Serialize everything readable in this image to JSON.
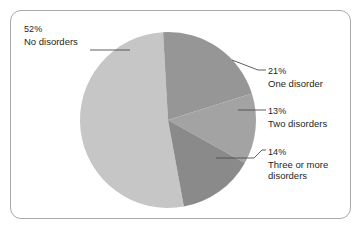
{
  "figure": {
    "background_color": "#ffffff",
    "border_color": "#a9a9a9"
  },
  "chart_data": {
    "type": "pie",
    "title": "",
    "subtitle": "",
    "xlabel": "",
    "ylabel": "",
    "legend_position": "callout-labels",
    "grid": false,
    "total": 100,
    "unit": "%",
    "categories": [
      "No disorders",
      "One disorder",
      "Two disorders",
      "Three or more disorders"
    ],
    "values": [
      52,
      21,
      13,
      14
    ],
    "colors": [
      "#c6c6c6",
      "#969696",
      "#a3a3a3",
      "#8a8a8a"
    ],
    "slices": [
      {
        "label": "No disorders",
        "value": 52,
        "percent_text": "52%",
        "color": "#c6c6c6",
        "start_angle_deg": 172,
        "end_angle_deg": 359.2
      },
      {
        "label": "One disorder",
        "value": 21,
        "percent_text": "21%",
        "color": "#969696",
        "start_angle_deg": 359.2,
        "end_angle_deg": 75.8
      },
      {
        "label": "Two disorders",
        "value": 13,
        "percent_text": "13%",
        "color": "#a3a3a3",
        "start_angle_deg": 75.8,
        "end_angle_deg": 122.6
      },
      {
        "label": "Three or more disorders",
        "value": 14,
        "percent_text": "14%",
        "color": "#8a8a8a",
        "start_angle_deg": 122.6,
        "end_angle_deg": 172
      }
    ]
  },
  "labels": {
    "no_disorders": {
      "percent": "52%",
      "name": "No disorders"
    },
    "one_disorder": {
      "percent": "21%",
      "name": "One disorder"
    },
    "two_disorders": {
      "percent": "13%",
      "name": "Two disorders"
    },
    "three_or_more": {
      "percent": "14%",
      "name_line1": "Three or more",
      "name_line2": "disorders"
    }
  }
}
